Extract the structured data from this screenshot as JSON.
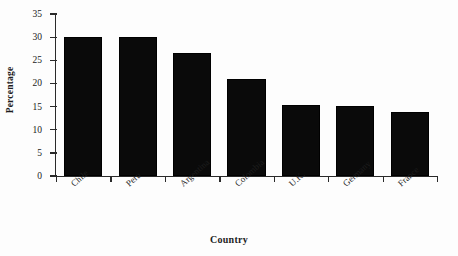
{
  "chart_data": {
    "type": "bar",
    "title": "",
    "xlabel": "Country",
    "ylabel": "Percentage",
    "categories": [
      "Chile",
      "Peru",
      "Argentina",
      "Colombia",
      "U.K.",
      "Germany",
      "France"
    ],
    "values": [
      30.0,
      30.0,
      26.5,
      21.0,
      15.4,
      15.2,
      13.8
    ],
    "ylim": [
      0,
      35
    ],
    "yticks": [
      "0",
      "5",
      "10",
      "15",
      "20",
      "25",
      "30",
      "35"
    ],
    "ytick_values": [
      0,
      5,
      10,
      15,
      20,
      25,
      30,
      35
    ],
    "grid": false,
    "legend": "none",
    "bar_color": "#0a0a0a",
    "axis_color": "#2a2a2a",
    "background_color": "#ffffff"
  }
}
